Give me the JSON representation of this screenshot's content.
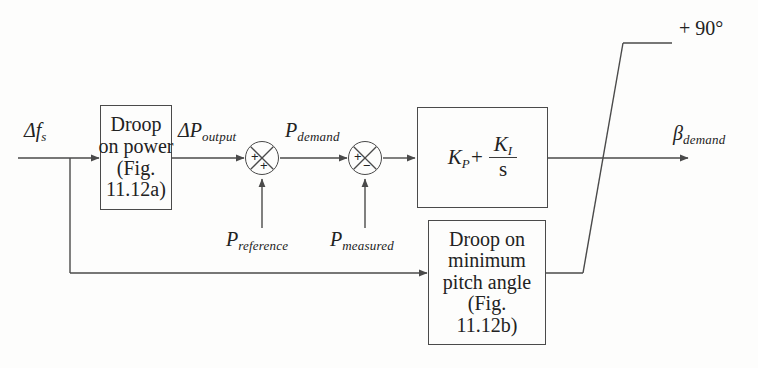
{
  "diagram": {
    "line_color": "#4a4a4a",
    "text_color": "#222222",
    "background": "#fdfdfc"
  },
  "signals": {
    "input_frequency": {
      "base": "Δf",
      "sub": "s"
    },
    "droop_output": {
      "base": "ΔP",
      "sub": "output"
    },
    "power_demand": {
      "base": "P",
      "sub": "demand"
    },
    "power_reference": {
      "base": "P",
      "sub": "reference"
    },
    "power_measured": {
      "base": "P",
      "sub": "measured"
    },
    "pitch_demand": {
      "base": "β",
      "sub": "demand"
    }
  },
  "blocks": {
    "droop_on_power": {
      "name": "Droop on power",
      "lines": [
        "Droop",
        "on power",
        "(Fig.",
        "11.12a)"
      ]
    },
    "pi_controller": {
      "name": "PI controller",
      "kp": "K",
      "kp_sub": "P",
      "plus": "+",
      "ki": "K",
      "ki_sub": "I",
      "denominator": "s"
    },
    "droop_on_pitch": {
      "name": "Droop on minimum pitch angle",
      "lines": [
        "Droop on",
        "minimum",
        "pitch angle",
        "(Fig.",
        "11.12b)"
      ]
    }
  },
  "summing_junctions": {
    "first": {
      "left_sign": "+",
      "bottom_sign": "+"
    },
    "second": {
      "left_sign": "+",
      "bottom_sign": "−"
    }
  },
  "limiter": {
    "upper_limit_label": "+ 90°"
  }
}
